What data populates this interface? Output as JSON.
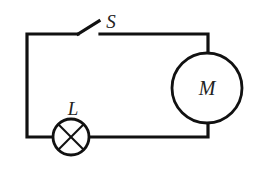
{
  "diagram": {
    "type": "circuit",
    "components": {
      "switch": {
        "label": "S",
        "state": "open"
      },
      "motor": {
        "label": "M"
      },
      "lamp": {
        "label": "L"
      }
    },
    "colors": {
      "line": "#111111",
      "background": "#ffffff"
    }
  }
}
